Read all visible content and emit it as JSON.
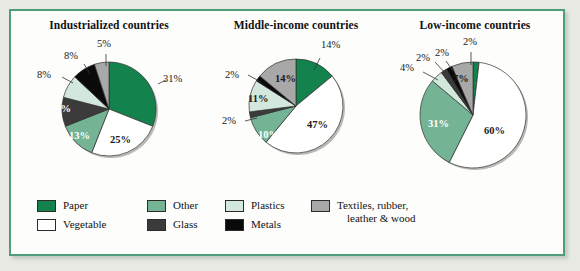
{
  "figure": {
    "border_color": "#4e9e79",
    "background": "#fdfdfb"
  },
  "legend": {
    "items": [
      {
        "label": "Paper",
        "color": "#13824c"
      },
      {
        "label": "Vegetable",
        "color": "#ffffff"
      },
      {
        "label": "Other",
        "color": "#74b495"
      },
      {
        "label": "Glass",
        "color": "#3b3b3b"
      },
      {
        "label": "Plastics",
        "color": "#d3e8dd"
      },
      {
        "label": "Metals",
        "color": "#0a0a0a"
      },
      {
        "label": "Textiles, rubber,",
        "label2": "leather & wood",
        "color": "#a8a8a8"
      }
    ]
  },
  "chart_data": [
    {
      "type": "pie",
      "title": "Industrialized countries",
      "categories": [
        "Paper",
        "Vegetable",
        "Other",
        "Glass",
        "Plastics",
        "Metals",
        "Textiles, rubber, leather & wood"
      ],
      "values": [
        31,
        25,
        13,
        10,
        8,
        8,
        5
      ],
      "labels": [
        "31%",
        "25%",
        "13%",
        "10%",
        "8%",
        "8%",
        "5%"
      ],
      "colors": [
        "#13824c",
        "#ffffff",
        "#74b495",
        "#3b3b3b",
        "#d3e8dd",
        "#0a0a0a",
        "#a8a8a8"
      ],
      "xlabel": "",
      "ylabel": "",
      "grid": false,
      "legend_position": "bottom"
    },
    {
      "type": "pie",
      "title": "Middle-income countries",
      "categories": [
        "Paper",
        "Vegetable",
        "Other",
        "Glass",
        "Plastics",
        "Metals",
        "Textiles, rubber, leather & wood"
      ],
      "values": [
        14,
        47,
        10,
        2,
        11,
        2,
        14
      ],
      "labels": [
        "14%",
        "47%",
        "10%",
        "2%",
        "11%",
        "2%",
        "14%"
      ],
      "colors": [
        "#13824c",
        "#ffffff",
        "#74b495",
        "#3b3b3b",
        "#d3e8dd",
        "#0a0a0a",
        "#a8a8a8"
      ],
      "xlabel": "",
      "ylabel": "",
      "grid": false,
      "legend_position": "bottom"
    },
    {
      "type": "pie",
      "title": "Low-income countries",
      "categories": [
        "Paper",
        "Vegetable",
        "Other",
        "Plastics",
        "Glass",
        "Metals",
        "Textiles, rubber, leather & wood"
      ],
      "values": [
        2,
        60,
        31,
        4,
        2,
        2,
        7
      ],
      "labels": [
        "2%",
        "60%",
        "31%",
        "4%",
        "2%",
        "2%",
        "7%"
      ],
      "colors": [
        "#13824c",
        "#ffffff",
        "#74b495",
        "#d3e8dd",
        "#3b3b3b",
        "#0a0a0a",
        "#a8a8a8"
      ],
      "xlabel": "",
      "ylabel": "",
      "grid": false,
      "legend_position": "bottom"
    }
  ]
}
